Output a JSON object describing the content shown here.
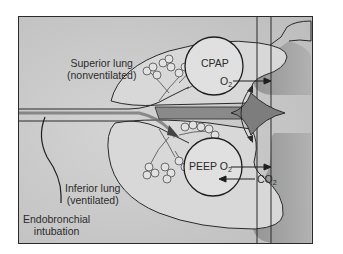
{
  "figure": {
    "labels": {
      "superior_lung_line1": "Superior lung",
      "superior_lung_line2": "(nonventilated)",
      "inferior_lung_line1": "Inferior lung",
      "inferior_lung_line2": "(ventilated)",
      "intubation_line1": "Endobronchial",
      "intubation_line2": "intubation",
      "cpap": "CPAP",
      "cpap_gas": "O",
      "cpap_gas_sub": "2",
      "peep": "PEEP O",
      "peep_sub": "2",
      "co2": "CO",
      "co2_sub": "2"
    },
    "colors": {
      "background": "#c9c9c9",
      "lung_fill": "#d6d6d6",
      "dark_region": "#9a9a9a",
      "line": "#2a2a2a"
    }
  }
}
